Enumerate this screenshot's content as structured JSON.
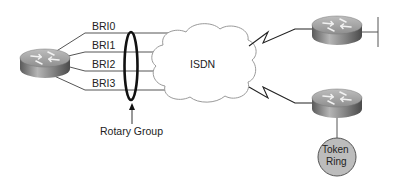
{
  "diagram": {
    "interfaces": [
      {
        "label": "BRI0"
      },
      {
        "label": "BRI1"
      },
      {
        "label": "BRI2"
      },
      {
        "label": "BRI3"
      }
    ],
    "rotary_group_label": "Rotary Group",
    "cloud_label": "ISDN",
    "token_ring_label_line1": "Token",
    "token_ring_label_line2": "Ring",
    "colors": {
      "line": "#555555",
      "ellipse": "#111111",
      "cloud_stroke": "#999999",
      "token_ring_fill": "#bbbbbb",
      "router_body": "#8a8a8a"
    }
  }
}
